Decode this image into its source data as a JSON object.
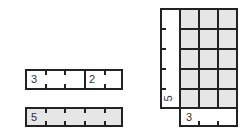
{
  "diagram": {
    "bar_split": {
      "left_label": "3",
      "right_label": "2",
      "total_units": 5
    },
    "bar_whole": {
      "label": "5",
      "total_units": 5,
      "fill": "#e6e6e6"
    },
    "area_model": {
      "rows": 5,
      "cols": 3,
      "row_label": "5",
      "col_label": "3",
      "fill": "#e6e6e6"
    }
  }
}
